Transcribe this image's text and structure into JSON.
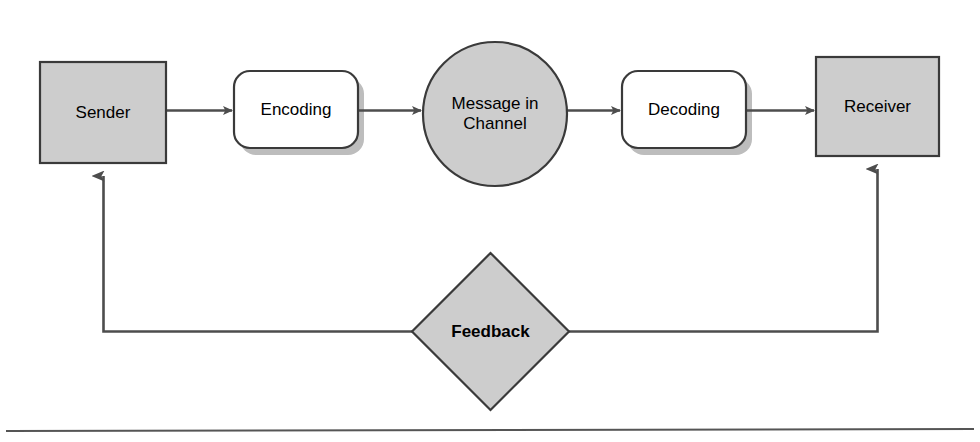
{
  "diagram": {
    "colors": {
      "shape_fill_gray": "#cdcdcd",
      "shape_fill_white": "#ffffff",
      "stroke": "#4d4d4d",
      "stroke_dark": "#3a3a3a",
      "text": "#000000",
      "shadow": "#b8b8b8",
      "rule": "#555555",
      "background": "#ffffff"
    },
    "nodes": [
      {
        "id": "sender",
        "label": "Sender",
        "shape": "rectangle",
        "fill": "gray",
        "x": 40,
        "y": 62,
        "width": 126,
        "height": 101
      },
      {
        "id": "encoding",
        "label": "Encoding",
        "shape": "rounded-rectangle",
        "fill": "white",
        "x": 234,
        "y": 71,
        "width": 124,
        "height": 77
      },
      {
        "id": "channel",
        "label": "Message in\nChannel",
        "shape": "circle",
        "fill": "gray",
        "x": 423,
        "y": 42,
        "width": 144,
        "height": 144
      },
      {
        "id": "decoding",
        "label": "Decoding",
        "shape": "rounded-rectangle",
        "fill": "white",
        "x": 622,
        "y": 71,
        "width": 124,
        "height": 77
      },
      {
        "id": "receiver",
        "label": "Receiver",
        "shape": "rectangle",
        "fill": "gray",
        "x": 816,
        "y": 57,
        "width": 123,
        "height": 99
      },
      {
        "id": "feedback",
        "label": "Feedback",
        "shape": "diamond",
        "fill": "gray",
        "bold": true,
        "x": 412,
        "y": 253,
        "width": 157,
        "height": 157
      }
    ],
    "connectors": [
      {
        "id": "sender-to-encoding",
        "from": "sender",
        "to": "encoding",
        "arrow": "right"
      },
      {
        "id": "encoding-to-channel",
        "from": "encoding",
        "to": "channel",
        "arrow": "right"
      },
      {
        "id": "channel-to-decoding",
        "from": "channel",
        "to": "decoding",
        "arrow": "right"
      },
      {
        "id": "decoding-to-receiver",
        "from": "decoding",
        "to": "receiver",
        "arrow": "right"
      },
      {
        "id": "feedback-to-sender",
        "from": "feedback",
        "to": "sender",
        "arrow": "up"
      },
      {
        "id": "feedback-to-receiver",
        "from": "feedback",
        "to": "receiver",
        "arrow": "up"
      }
    ],
    "footer_rule": {
      "y": 430
    }
  }
}
